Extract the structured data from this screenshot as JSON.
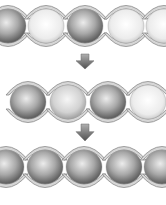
{
  "diagram": {
    "colors": {
      "background": "#ffffff",
      "tube_fill": "#d6d6d6",
      "tube_stroke": "#8a8a8a",
      "ball_dark_center": "#e8e8e8",
      "ball_dark_edge": "#5a5a5a",
      "ball_light_center": "#ffffff",
      "ball_light_edge": "#c4c4c4",
      "arrow_top": "#9a9a9a",
      "arrow_bottom": "#555555"
    },
    "rows": [
      {
        "name": "stage-1",
        "cy": 26,
        "balls": [
          {
            "cx": 8,
            "type": "dark"
          },
          {
            "cx": 46,
            "type": "light"
          },
          {
            "cx": 85,
            "type": "dark"
          },
          {
            "cx": 126,
            "type": "light"
          },
          {
            "cx": 164,
            "type": "light"
          }
        ]
      },
      {
        "name": "stage-2",
        "cy": 102,
        "balls": [
          {
            "cx": 28,
            "type": "dark"
          },
          {
            "cx": 68,
            "type": "light-gray"
          },
          {
            "cx": 108,
            "type": "dark"
          },
          {
            "cx": 148,
            "type": "light"
          }
        ]
      },
      {
        "name": "stage-3",
        "cy": 167,
        "balls": [
          {
            "cx": 6,
            "type": "dark"
          },
          {
            "cx": 45,
            "type": "dark"
          },
          {
            "cx": 84,
            "type": "dark"
          },
          {
            "cx": 124,
            "type": "dark"
          },
          {
            "cx": 162,
            "type": "dark"
          }
        ]
      }
    ],
    "arrows": [
      {
        "name": "arrow-1",
        "x": 85,
        "y_top": 54,
        "y_bottom": 69
      },
      {
        "name": "arrow-2",
        "x": 85,
        "y_top": 124,
        "y_bottom": 141
      }
    ]
  }
}
